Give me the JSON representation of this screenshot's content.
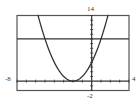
{
  "chart_data": {
    "type": "line",
    "title": "",
    "xlabel": "",
    "ylabel": "",
    "xlim": [
      -8,
      4
    ],
    "ylim": [
      -2,
      14
    ],
    "grid": false,
    "x_tick_step": 1,
    "y_tick_step": 1,
    "tick_labels": {
      "xmin": "-8",
      "xmax": "4",
      "ymin": "-2",
      "ymax": "14"
    },
    "series": [
      {
        "name": "y = (x + 2)^2",
        "kind": "function",
        "expr": "(x+2)^2",
        "color": "#333333"
      },
      {
        "name": "y = 9",
        "kind": "function",
        "expr": "9",
        "color": "#333333"
      }
    ]
  },
  "colors": {
    "frame": "#444444",
    "axis": "#333333",
    "curve": "#333333",
    "background": "#ffffff"
  }
}
